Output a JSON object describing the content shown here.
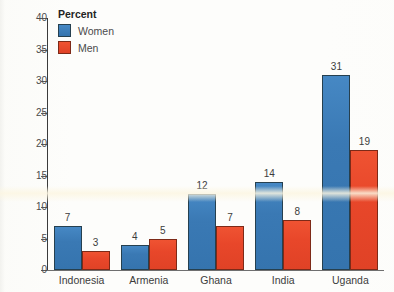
{
  "chart_data": {
    "type": "bar",
    "title": "",
    "subtitle": "",
    "xlabel": "",
    "ylabel": "",
    "categories": [
      "Indonesia",
      "Armenia",
      "Ghana",
      "India",
      "Uganda"
    ],
    "series": [
      {
        "name": "Women",
        "color": "#3a79b4",
        "values": [
          7,
          4,
          12,
          14,
          31
        ]
      },
      {
        "name": "Men",
        "color": "#e8472a",
        "values": [
          3,
          5,
          7,
          8,
          19
        ]
      }
    ],
    "ylim": [
      0,
      40
    ],
    "ytick_step": 5,
    "ytick_labels": [
      "0",
      "5",
      "10",
      "15",
      "20",
      "25",
      "30",
      "35",
      "40"
    ],
    "grid": false,
    "legend_position": "upper-left-inside",
    "value_labels_shown": true
  },
  "legend": {
    "title": "Percent",
    "entries": [
      {
        "label": "Women",
        "swatch": "women-swatch"
      },
      {
        "label": "Men",
        "swatch": "men-swatch"
      }
    ]
  },
  "axes": {
    "y_ticks": [
      {
        "value": 40,
        "label": "40"
      },
      {
        "value": 35,
        "label": "35"
      },
      {
        "value": 30,
        "label": "30"
      },
      {
        "value": 25,
        "label": "25"
      },
      {
        "value": 20,
        "label": "20"
      },
      {
        "value": 15,
        "label": "15"
      },
      {
        "value": 10,
        "label": "10"
      },
      {
        "value": 5,
        "label": "5"
      },
      {
        "value": 0,
        "label": "0"
      }
    ]
  },
  "bars": [
    {
      "category": "Indonesia",
      "women": "7",
      "men": "3"
    },
    {
      "category": "Armenia",
      "women": "4",
      "men": "5"
    },
    {
      "category": "Ghana",
      "women": "12",
      "men": "7"
    },
    {
      "category": "India",
      "women": "14",
      "men": "8"
    },
    {
      "category": "Uganda",
      "women": "31",
      "men": "19"
    }
  ],
  "colors": {
    "women": "#3a79b4",
    "men": "#e8472a",
    "bar_outline": "#2d3b46",
    "axis": "#3b3b3b",
    "text": "#3c3c3c",
    "background": "#fdfdfb"
  }
}
